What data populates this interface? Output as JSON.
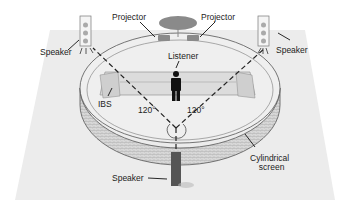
{
  "diagram": {
    "type": "listening-room-setup",
    "labels": {
      "projector_left": "Projector",
      "projector_right": "Projector",
      "speaker_left": "Speaker",
      "speaker_right": "Speaker",
      "speaker_front": "Speaker",
      "listener": "Listener",
      "ibs": "IBS",
      "angle_left": "120°",
      "angle_right": "120°",
      "screen_line1": "Cylindrical",
      "screen_line2": "screen"
    },
    "colors": {
      "floor": "#ececec",
      "screen_fill": "#d4d4d4",
      "outline": "#555555",
      "dashed": "#222222",
      "speaker_body": "#bdbdbd",
      "speaker_front_body": "#555555",
      "listener": "#111111",
      "projector": "#8a8a8a"
    }
  }
}
